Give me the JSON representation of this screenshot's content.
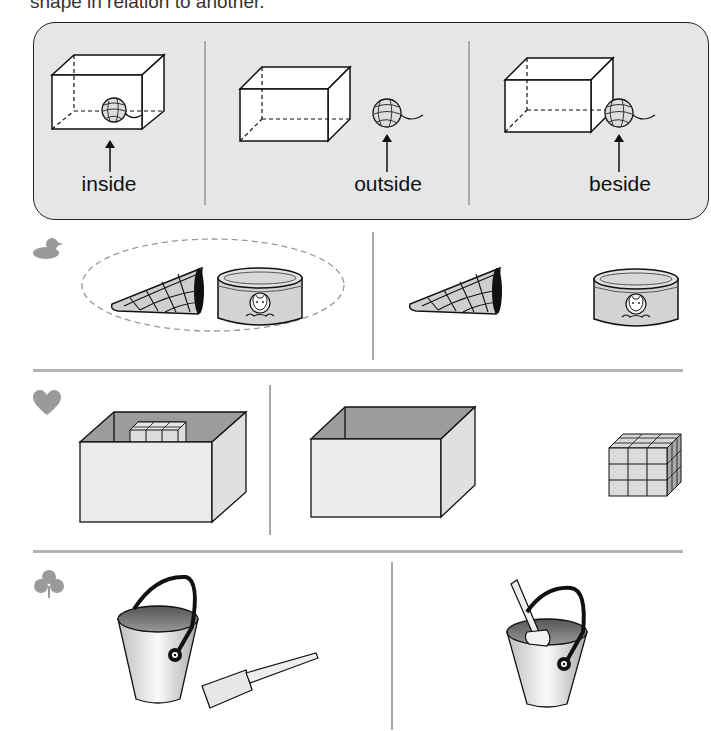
{
  "heading": {
    "text": "shape in relation to another."
  },
  "example_panel": {
    "background": "#e6e6e6",
    "items": [
      {
        "label": "inside",
        "relation": "ball-inside-box"
      },
      {
        "label": "outside",
        "relation": "ball-outside-box"
      },
      {
        "label": "beside",
        "relation": "ball-beside-box"
      }
    ]
  },
  "rows": [
    {
      "icon": "duck-icon",
      "options": [
        {
          "description": "cone next to cat-food can",
          "circled": true
        },
        {
          "description": "cone apart from cat-food can",
          "circled": false
        }
      ]
    },
    {
      "icon": "heart-icon",
      "options": [
        {
          "description": "block cube inside open box",
          "circled": false
        },
        {
          "description": "block cube outside open box",
          "circled": false
        }
      ]
    },
    {
      "icon": "club-icon",
      "options": [
        {
          "description": "shovel beside bucket",
          "circled": false
        },
        {
          "description": "shovel inside bucket",
          "circled": false
        }
      ]
    }
  ],
  "colors": {
    "icon_gray": "#9a9a9a",
    "divider_gray": "#b5b5b5",
    "circle_dash": "#999999"
  }
}
